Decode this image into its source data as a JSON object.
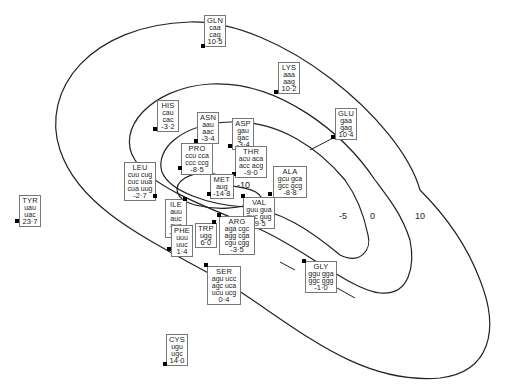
{
  "diagram": {
    "type": "contour map of amino acids with codons",
    "contour_labels": [
      "-10",
      "-5",
      "0",
      "10"
    ],
    "amino_acids": [
      {
        "name": "GLN",
        "codons": [
          "caa",
          "cag"
        ],
        "value": "10·5",
        "x": 204,
        "y": 15,
        "w": 22,
        "dot": [
          203,
          46
        ]
      },
      {
        "name": "LYS",
        "codons": [
          "aaa",
          "aag"
        ],
        "value": "10·2",
        "x": 278,
        "y": 62,
        "w": 22,
        "dot": [
          276,
          92
        ]
      },
      {
        "name": "GLU",
        "codons": [
          "gaa",
          "gag"
        ],
        "value": "10·4",
        "x": 335,
        "y": 108,
        "w": 22,
        "dot": [
          333,
          137
        ]
      },
      {
        "name": "HIS",
        "codons": [
          "cau",
          "cac"
        ],
        "value": "-3·2",
        "x": 157,
        "y": 100,
        "w": 22,
        "dot": [
          155,
          129
        ]
      },
      {
        "name": "ASN",
        "codons": [
          "aau",
          "aac"
        ],
        "value": "-3·4",
        "x": 197,
        "y": 112,
        "w": 22,
        "dot": [
          196,
          141
        ]
      },
      {
        "name": "ASP",
        "codons": [
          "gau",
          "gac"
        ],
        "value": "-3·4",
        "x": 232,
        "y": 118,
        "w": 22,
        "dot": [
          230,
          146
        ]
      },
      {
        "name": "PRO",
        "codons": [
          "ccu cca",
          "ccc ccg"
        ],
        "value": "-8·5",
        "x": 181,
        "y": 143,
        "w": 32,
        "dot": [
          180,
          168
        ]
      },
      {
        "name": "THR",
        "codons": [
          "acu aca",
          "acc acg"
        ],
        "value": "-9·0",
        "x": 235,
        "y": 146,
        "w": 32,
        "dot": [
          234,
          174
        ]
      },
      {
        "name": "ALA",
        "codons": [
          "gcu gca",
          "gcc gcg"
        ],
        "value": "-8·8",
        "x": 273,
        "y": 166,
        "w": 34,
        "dot": [
          270,
          194
        ]
      },
      {
        "name": "LEU",
        "codons": [
          "cuu cug",
          "cuc uua",
          "cua uug"
        ],
        "value": "-2·7",
        "x": 124,
        "y": 162,
        "w": 32,
        "dot": [
          155,
          196
        ]
      },
      {
        "name": "MET",
        "codons": [
          "aug"
        ],
        "value": "-14·8",
        "x": 210,
        "y": 174,
        "w": 22,
        "dot": [
          209,
          194
        ]
      },
      {
        "name": "VAL",
        "codons": [
          "guu gua",
          "guc gug"
        ],
        "value": "-9·5",
        "x": 243,
        "y": 197,
        "w": 32,
        "dot": [
          243,
          196
        ]
      },
      {
        "name": "ILE",
        "codons": [
          "auu",
          "auc",
          "aua"
        ],
        "value": "-8·9",
        "x": 165,
        "y": 199,
        "w": 22,
        "dot": [
          185,
          199
        ]
      },
      {
        "name": "ARG",
        "codons": [
          "aga cgc",
          "agg cga",
          "cgu cgg"
        ],
        "value": "-3·5",
        "x": 219,
        "y": 216,
        "w": 36,
        "dot": [
          219,
          215
        ]
      },
      {
        "name": "TRP",
        "codons": [
          "ugg"
        ],
        "value": "6·0",
        "x": 195,
        "y": 223,
        "w": 20,
        "dot": [
          214,
          222
        ]
      },
      {
        "name": "PHE",
        "codons": [
          "uuu",
          "uuc"
        ],
        "value": "1·4",
        "x": 171,
        "y": 225,
        "w": 20,
        "dot": [
          169,
          249
        ]
      },
      {
        "name": "TYR",
        "codons": [
          "uau",
          "uac"
        ],
        "value": "23·7",
        "x": 19,
        "y": 195,
        "w": 22,
        "dot": [
          17,
          221
        ]
      },
      {
        "name": "SER",
        "codons": [
          "agu ucc",
          "agc uca",
          "ucu ucg"
        ],
        "value": "0·4",
        "x": 207,
        "y": 266,
        "w": 34,
        "dot": [
          206,
          265
        ]
      },
      {
        "name": "GLY",
        "codons": [
          "ggu gga",
          "ggc ggg"
        ],
        "value": "-1·0",
        "x": 305,
        "y": 261,
        "w": 32,
        "dot": [
          304,
          261
        ]
      },
      {
        "name": "CYS",
        "codons": [
          "ugu",
          "ugc"
        ],
        "value": "14·0",
        "x": 166,
        "y": 334,
        "w": 22,
        "dot": [
          165,
          364
        ]
      }
    ]
  }
}
